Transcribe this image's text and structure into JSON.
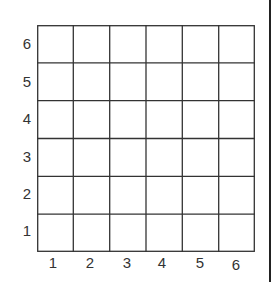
{
  "diagram": {
    "type": "coordinate-grid",
    "rows": 6,
    "cols": 6,
    "x_labels": [
      "1",
      "2",
      "3",
      "4",
      "5",
      "6"
    ],
    "y_labels": [
      "6",
      "5",
      "4",
      "3",
      "2",
      "1"
    ],
    "line_color": "#333333"
  }
}
